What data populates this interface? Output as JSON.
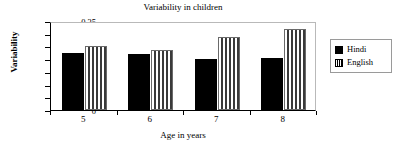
{
  "chart_data": {
    "type": "bar",
    "title": "Variability in children",
    "xlabel": "Age in years",
    "ylabel": "Variability",
    "categories": [
      "5",
      "6",
      "7",
      "8"
    ],
    "series": [
      {
        "name": "Hindi",
        "values": [
          0.225,
          0.22,
          0.202,
          0.203
        ]
      },
      {
        "name": "English",
        "values": [
          0.253,
          0.237,
          0.288,
          0.32
        ]
      }
    ],
    "ylim": [
      0,
      0.35
    ],
    "yticks": [
      "0",
      "0.05",
      "0.1",
      "0.15",
      "0.2",
      "0.25",
      "0.3",
      "0.35"
    ],
    "ytick_values": [
      0,
      0.05,
      0.1,
      0.15,
      0.2,
      0.25,
      0.3,
      0.35
    ],
    "grid": false,
    "legend_position": "right",
    "colors": {
      "hindi": "#000000",
      "english": "#ffffff",
      "english_hatch": "#333333",
      "axis": "#000000",
      "plot_border": "#b9b9b9",
      "background": "#ffffff"
    }
  }
}
